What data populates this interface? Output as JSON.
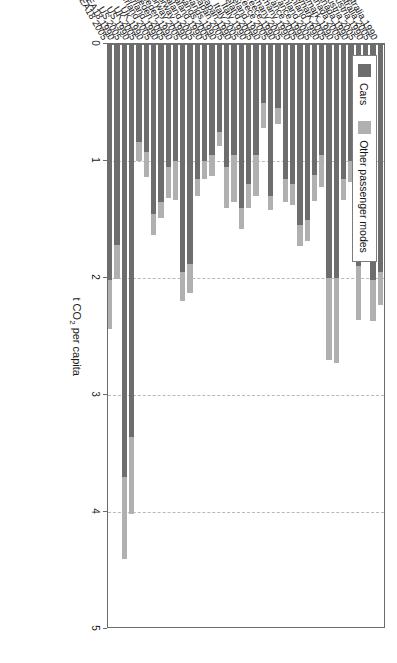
{
  "chart_data": {
    "type": "bar",
    "orientation": "horizontal-stacked",
    "title": "",
    "xlabel": "",
    "ylabel": "t CO2 per capita",
    "ylabel_parts": {
      "pre": "t CO",
      "sub": "2",
      "post": " per capita"
    },
    "ylim": [
      0,
      5
    ],
    "ticks": [
      "0",
      "1",
      "2",
      "3",
      "4",
      "5"
    ],
    "grid": true,
    "legend_position": "top-left",
    "legend": [
      {
        "name": "Cars",
        "color": "#6d6d6d"
      },
      {
        "name": "Other passenger modes",
        "color": "#b0b0b0"
      }
    ],
    "categories": [
      "Australia 1990",
      "Australia 2005",
      "Austria 1990",
      "Austria 2005",
      "Canada 1990",
      "Canada 2005",
      "Denmark 1990",
      "Denmark 2005",
      "Finland 1990",
      "Finland 2005",
      "France 1990",
      "France 2005",
      "Germany 1990",
      "Germany 2005",
      "Greece 1990",
      "Greece 2005",
      "Ireland 1990",
      "Ireland 2005",
      "Italy 1990",
      "Italy 2005",
      "Japan 1990",
      "Japan 2005",
      "Netherlands 1990",
      "Netherlands 2005",
      "New Zealand 1990",
      "New Zealand 2005",
      "Norway 1990",
      "Norway 2005",
      "Sweden 1990",
      "Sweden 2005",
      "Switzerland 1990",
      "Switzerland 2005",
      "UK 1990",
      "UK 2005",
      "US 1990",
      "US 2005",
      "IEA18 1990",
      "IEA18 2005"
    ],
    "series": [
      {
        "name": "Cars",
        "color": "#6d6d6d",
        "values": [
          1.95,
          2.02,
          1.2,
          1.9,
          1.0,
          1.15,
          2.0,
          2.0,
          0.95,
          1.12,
          1.5,
          1.55,
          1.2,
          1.15,
          0.55,
          1.3,
          0.5,
          0.95,
          1.2,
          1.4,
          0.95,
          1.05,
          0.75,
          0.95,
          1.0,
          1.15,
          1.88,
          1.95,
          1.0,
          1.05,
          1.35,
          1.45,
          0.92,
          0.84,
          3.36,
          3.7,
          1.72,
          2.02
        ]
      },
      {
        "name": "Other passenger modes",
        "color": "#b0b0b0",
        "values": [
          0.28,
          0.35,
          0.18,
          0.46,
          0.18,
          0.18,
          0.73,
          0.7,
          0.27,
          0.22,
          0.18,
          0.18,
          0.18,
          0.2,
          0.13,
          0.12,
          0.22,
          0.35,
          0.2,
          0.18,
          0.4,
          0.35,
          0.12,
          0.18,
          0.15,
          0.15,
          0.25,
          0.25,
          0.33,
          0.27,
          0.14,
          0.18,
          0.22,
          0.16,
          0.66,
          0.7,
          0.29,
          0.42
        ]
      }
    ]
  },
  "axis": {
    "y_title_pre": "t CO",
    "y_title_sub": "2",
    "y_title_post": " per capita"
  }
}
